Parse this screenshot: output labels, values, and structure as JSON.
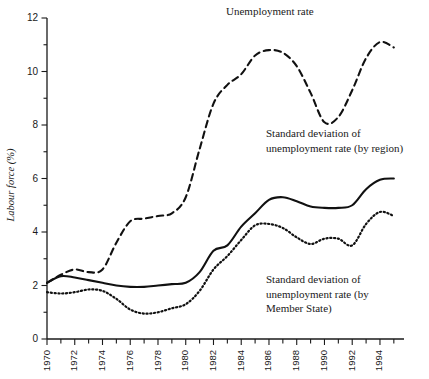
{
  "chart_data": {
    "type": "line",
    "title": "",
    "xlabel": "",
    "ylabel": "Labour force (%)",
    "xlim": [
      1970,
      1995.3
    ],
    "ylim": [
      0,
      12
    ],
    "grid": false,
    "legend_position": "inline-annotations",
    "x": [
      1970,
      1971,
      1972,
      1973,
      1974,
      1975,
      1976,
      1977,
      1978,
      1979,
      1980,
      1981,
      1982,
      1983,
      1984,
      1985,
      1986,
      1987,
      1988,
      1989,
      1990,
      1991,
      1992,
      1993,
      1994,
      1995
    ],
    "series": [
      {
        "name": "Unemployment rate",
        "style": "dashed",
        "values": [
          2.1,
          2.4,
          2.6,
          2.5,
          2.6,
          3.6,
          4.4,
          4.5,
          4.6,
          4.7,
          5.3,
          7.1,
          8.8,
          9.5,
          9.9,
          10.6,
          10.8,
          10.7,
          10.2,
          9.2,
          8.1,
          8.3,
          9.3,
          10.5,
          11.1,
          10.9
        ]
      },
      {
        "name": "Standard deviation of unemployment rate (by region)",
        "style": "solid",
        "values": [
          2.1,
          2.35,
          2.3,
          2.2,
          2.1,
          2.0,
          1.95,
          1.95,
          2.0,
          2.05,
          2.1,
          2.5,
          3.3,
          3.5,
          4.2,
          4.7,
          5.2,
          5.3,
          5.15,
          4.95,
          4.9,
          4.9,
          5.0,
          5.6,
          5.95,
          6.0
        ]
      },
      {
        "name": "Standard deviation of unemployment rate (by Member State)",
        "style": "dotted",
        "values": [
          1.75,
          1.7,
          1.75,
          1.85,
          1.8,
          1.5,
          1.1,
          0.95,
          1.0,
          1.15,
          1.3,
          1.8,
          2.6,
          3.1,
          3.7,
          4.25,
          4.3,
          4.15,
          3.8,
          3.55,
          3.75,
          3.75,
          3.5,
          4.3,
          4.75,
          4.6
        ]
      }
    ],
    "y_ticks": [
      0,
      2,
      4,
      6,
      8,
      10,
      12
    ],
    "x_ticks_labeled": [
      1970,
      1972,
      1974,
      1976,
      1978,
      1980,
      1982,
      1984,
      1986,
      1988,
      1990,
      1992,
      1994
    ],
    "x_ticks_minor": [
      1971,
      1973,
      1975,
      1977,
      1979,
      1981,
      1983,
      1985,
      1987,
      1989,
      1991,
      1993,
      1995
    ]
  },
  "annotations": {
    "unemployment_rate": "Unemployment rate",
    "sd_by_region": "Standard deviation of\nunemployment rate (by region)",
    "sd_by_member_state": "Standard deviation of\nunemployment rate (by\nMember State)"
  },
  "axis": {
    "y_title": "Labour force (%)"
  },
  "colors": {
    "ink": "#1a1a1a",
    "line": "#111111",
    "background": "#ffffff"
  }
}
